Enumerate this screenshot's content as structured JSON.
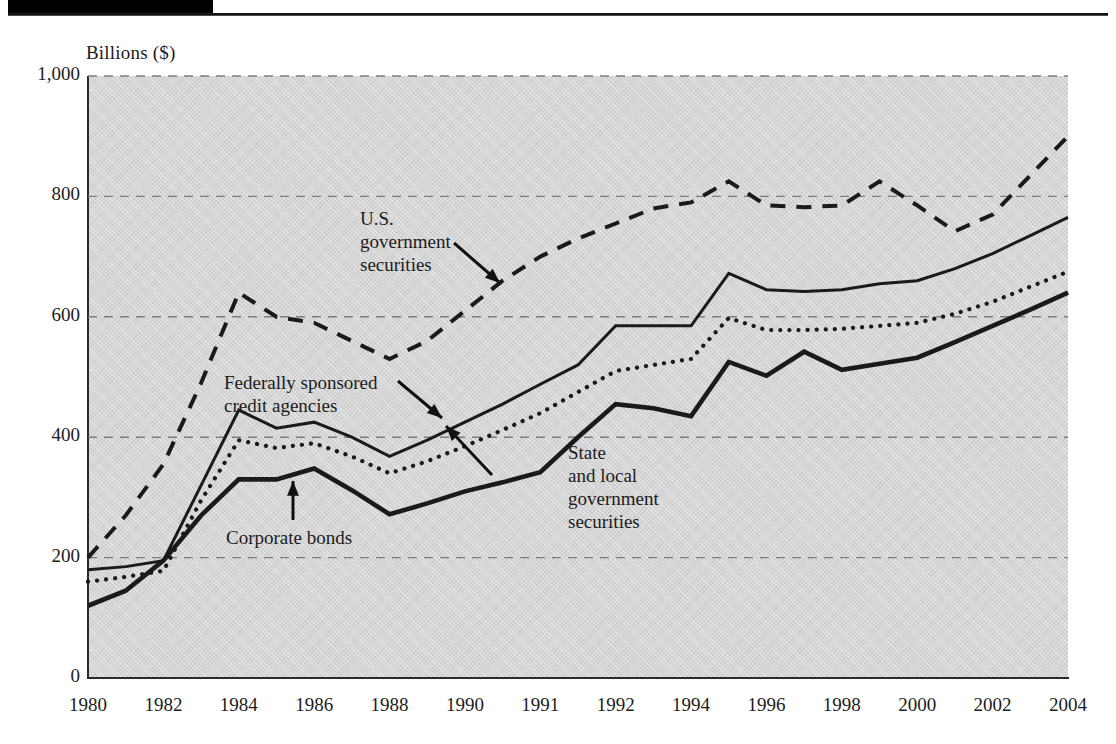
{
  "axis_title": "Billions ($)",
  "annotations": {
    "us_gov": "U.S.\ngovernment\nsecurities",
    "fed_credit": "Federally sponsored\ncredit agencies",
    "corporate": "Corporate bonds",
    "state_local": "State\nand local\ngovernment\nsecurities"
  },
  "colors": {
    "plot_background": "#d6d6d6",
    "axis": "#2b2b2b",
    "gridline": "#7d7d7d",
    "series_line": "#1a1a1a",
    "top_bar": "#000000"
  },
  "chart_data": {
    "type": "line",
    "title": "",
    "subtitle": "",
    "xlabel": "",
    "ylabel": "Billions ($)",
    "ylim": [
      0,
      1000
    ],
    "yticks": [
      0,
      200,
      400,
      600,
      800,
      1000
    ],
    "ytick_labels": [
      "0",
      "200",
      "400",
      "600",
      "800",
      "1,000"
    ],
    "grid": "horizontal-dashed",
    "legend": "none-inline-annotations",
    "categories": [
      "1980",
      "1982",
      "1984",
      "1986",
      "1988",
      "1990",
      "1991",
      "1992",
      "1994",
      "1996",
      "1998",
      "2000",
      "2002",
      "2004"
    ],
    "x_positions": [
      0,
      1,
      2,
      3,
      4,
      5,
      6,
      7,
      8,
      9,
      10,
      11,
      12,
      13
    ],
    "series": [
      {
        "name": "U.S. government securities",
        "style": "dashed",
        "x": [
          0,
          0.5,
          1,
          1.5,
          2,
          2.5,
          3,
          3.5,
          4,
          4.5,
          5,
          5.5,
          6,
          6.5,
          7,
          7.5,
          8,
          8.5,
          9,
          9.5,
          10,
          10.5,
          11,
          11.5,
          12,
          12.5,
          13
        ],
        "values": [
          200,
          270,
          355,
          490,
          640,
          600,
          590,
          560,
          530,
          560,
          610,
          660,
          700,
          730,
          755,
          780,
          790,
          825,
          785,
          782,
          785,
          825,
          785,
          742,
          770,
          835,
          900
        ]
      },
      {
        "name": "Federally sponsored credit agencies",
        "style": "solid-thin",
        "x": [
          0,
          0.5,
          1,
          1.5,
          2,
          2.5,
          3,
          3.5,
          4,
          4.5,
          5,
          5.5,
          6,
          6.5,
          7,
          7.5,
          8,
          8.5,
          9,
          9.5,
          10,
          10.5,
          11,
          11.5,
          12,
          12.5,
          13
        ],
        "values": [
          180,
          185,
          195,
          320,
          445,
          415,
          425,
          400,
          368,
          395,
          425,
          455,
          488,
          520,
          585,
          585,
          585,
          672,
          645,
          642,
          645,
          655,
          660,
          680,
          705,
          735,
          765
        ]
      },
      {
        "name": "State and local government securities",
        "style": "dotted",
        "x": [
          0,
          0.5,
          1,
          1.5,
          2,
          2.5,
          3,
          3.5,
          4,
          4.5,
          5,
          5.5,
          6,
          6.5,
          7,
          7.5,
          8,
          8.5,
          9,
          9.5,
          10,
          10.5,
          11,
          11.5,
          12,
          12.5,
          13
        ],
        "values": [
          160,
          168,
          178,
          295,
          395,
          382,
          390,
          368,
          340,
          360,
          385,
          412,
          440,
          475,
          510,
          520,
          530,
          598,
          578,
          578,
          580,
          585,
          590,
          605,
          625,
          650,
          675
        ]
      },
      {
        "name": "Corporate bonds",
        "style": "solid-thick",
        "x": [
          0,
          0.5,
          1,
          1.5,
          2,
          2.5,
          3,
          3.5,
          4,
          4.5,
          5,
          5.5,
          6,
          6.5,
          7,
          7.5,
          8,
          8.5,
          9,
          9.5,
          10,
          10.5,
          11,
          11.5,
          12,
          12.5,
          13
        ],
        "values": [
          120,
          145,
          195,
          270,
          330,
          330,
          348,
          312,
          272,
          290,
          310,
          325,
          342,
          400,
          455,
          448,
          435,
          525,
          502,
          542,
          512,
          522,
          532,
          558,
          585,
          612,
          640
        ]
      }
    ]
  }
}
